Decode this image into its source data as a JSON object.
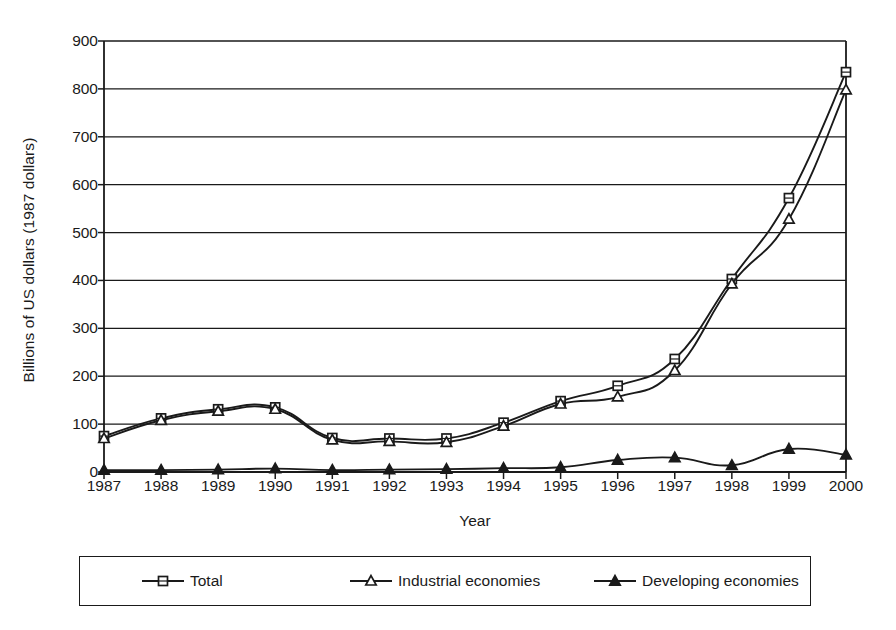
{
  "chart_data": {
    "type": "line",
    "title": "",
    "xlabel": "Year",
    "ylabel": "Billions of US dollars (1987 dollars)",
    "categories": [
      "1987",
      "1988",
      "1989",
      "1990",
      "1991",
      "1992",
      "1993",
      "1994",
      "1995",
      "1996",
      "1997",
      "1998",
      "1999",
      "2000"
    ],
    "x": [
      1987,
      1988,
      1989,
      1990,
      1991,
      1992,
      1993,
      1994,
      1995,
      1996,
      1997,
      1998,
      1999,
      2000
    ],
    "xlim": [
      1987,
      2000
    ],
    "ylim": [
      0,
      900
    ],
    "yticks": [
      0,
      100,
      200,
      300,
      400,
      500,
      600,
      700,
      800,
      900
    ],
    "ytick_labels": [
      "0",
      "100",
      "200",
      "300",
      "400",
      "500",
      "600",
      "700",
      "800",
      "900"
    ],
    "grid": "horizontal",
    "legend_position": "bottom",
    "series": [
      {
        "name": "Total",
        "marker": "open-square",
        "values": [
          75,
          112,
          131,
          135,
          71,
          70,
          70,
          103,
          148,
          180,
          236,
          403,
          572,
          835
        ]
      },
      {
        "name": "Industrial economies",
        "marker": "open-triangle",
        "values": [
          70,
          108,
          127,
          131,
          67,
          64,
          62,
          96,
          142,
          157,
          212,
          393,
          528,
          798
        ]
      },
      {
        "name": "Developing economies",
        "marker": "filled-triangle",
        "values": [
          4,
          4,
          5,
          7,
          4,
          5,
          6,
          8,
          10,
          25,
          30,
          14,
          48,
          36
        ]
      }
    ]
  },
  "axis": {
    "y_title": "Billions of US dollars (1987 dollars)",
    "x_title": "Year"
  },
  "legend": {
    "items": [
      {
        "label": "Total",
        "marker": "open-square"
      },
      {
        "label": "Industrial economies",
        "marker": "open-triangle"
      },
      {
        "label": "Developing economies",
        "marker": "filled-triangle"
      }
    ]
  },
  "colors": {
    "ink": "#1a1a1a",
    "background": "#ffffff"
  }
}
